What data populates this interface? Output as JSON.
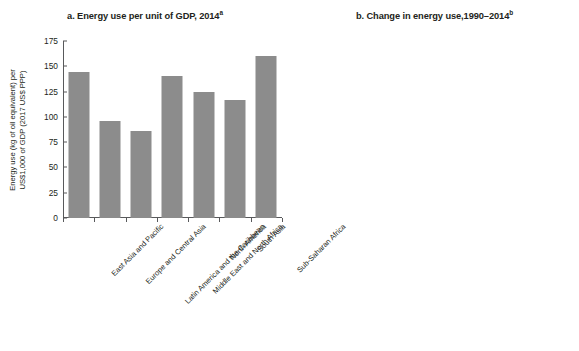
{
  "chart_data": [
    {
      "type": "bar",
      "panel": "a",
      "title": "a. Energy use per unit of GDP, 2014",
      "title_superscript": "a",
      "ylabel_lines": [
        "Energy use (kg of oil equivalent) per",
        "US$1,000 of GDP (2017 US$ PPP)"
      ],
      "xlabel": "",
      "categories": [
        "East Asia and Pacific",
        "Europe and Central Asia",
        "Latin America and the Caribbean",
        "Middle East and North Africa",
        "North America",
        "South Asia",
        "Sub-Saharan Africa"
      ],
      "values": [
        144,
        96,
        86,
        140,
        125,
        117,
        160
      ],
      "ticks": [
        0,
        25,
        50,
        75,
        100,
        125,
        150,
        175
      ],
      "tick_labels": [
        "0",
        "25",
        "50",
        "75",
        "100",
        "125",
        "150",
        "175"
      ],
      "ylim": [
        0,
        175
      ],
      "grid": false,
      "legend": "none",
      "bar_color": "#8c8c8c"
    },
    {
      "type": "bar",
      "panel": "b",
      "title": "b. Change in energy use,1990–2014",
      "title_superscript": "b",
      "ylabel_lines": [
        "Change in energy use since 1990 (%)"
      ],
      "xlabel": "",
      "categories": [
        "Middle East and North Africa",
        "Latin America and the Caribbean",
        "Sub-Saharan Africa",
        "East Asia and Pacific",
        "South Asia",
        "North America",
        "Europe and Central Asia"
      ],
      "values": [
        31,
        -9,
        -24,
        -26,
        -32.5,
        -35,
        -39.5
      ],
      "ticks": [
        -40,
        -30,
        -20,
        -10,
        0,
        10,
        20,
        30
      ],
      "tick_labels": [
        "−40",
        "−30",
        "−20",
        "−10",
        "0",
        "10",
        "20",
        "30"
      ],
      "ylim": [
        -40,
        33
      ],
      "zero_line": 0,
      "grid": false,
      "legend": "none",
      "bar_color": "#8c8c8c"
    }
  ]
}
